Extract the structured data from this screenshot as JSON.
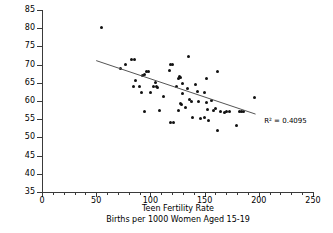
{
  "chart_data": {
    "type": "scatter",
    "title": "",
    "xlabel": "Teen Fertility Rate",
    "xlabel_line2": "Births per 1000 Women Aged 15-19",
    "ylabel": "Community Well-Being (CWB) Index Score",
    "xlim": [
      0,
      250
    ],
    "ylim": [
      35,
      85
    ],
    "x_major_ticks": [
      0,
      50,
      100,
      150,
      200,
      250
    ],
    "x_major_tick_labels": [
      "0",
      "50",
      "100",
      "150",
      "200",
      "250"
    ],
    "x_minor_tick_interval": 10,
    "y_major_ticks": [
      35,
      40,
      45,
      50,
      55,
      60,
      65,
      70,
      75,
      80,
      85
    ],
    "y_major_tick_labels": [
      "35",
      "40",
      "45",
      "50",
      "55",
      "60",
      "65",
      "70",
      "75",
      "80",
      "85"
    ],
    "grid": false,
    "legend": false,
    "marker_color": "#111111",
    "axis_color": "#3a3a3a",
    "annotations": [
      {
        "name": "r-squared",
        "text": "R² = 0.4095",
        "x": 205,
        "y": 54.5
      }
    ],
    "trendline": {
      "name": "linear-fit",
      "x_start": 50,
      "y_start": 71.1,
      "x_end": 197,
      "y_end": 56.4,
      "color": "#555555"
    },
    "points": [
      [
        55,
        80.3
      ],
      [
        72,
        68.8
      ],
      [
        77,
        70.1
      ],
      [
        83,
        71.4
      ],
      [
        85,
        71.5
      ],
      [
        84,
        63.9
      ],
      [
        86,
        65.5
      ],
      [
        90,
        64.0
      ],
      [
        92,
        62.4
      ],
      [
        93,
        67.0
      ],
      [
        95,
        67.2
      ],
      [
        96,
        68.1
      ],
      [
        98,
        68.0
      ],
      [
        95,
        57.2
      ],
      [
        100,
        62.4
      ],
      [
        103,
        63.9
      ],
      [
        105,
        65.2
      ],
      [
        106,
        64.0
      ],
      [
        107,
        63.7
      ],
      [
        108,
        57.3
      ],
      [
        112,
        61.1
      ],
      [
        118,
        68.5
      ],
      [
        119,
        70.0
      ],
      [
        120,
        70.0
      ],
      [
        119,
        54.2
      ],
      [
        121,
        54.2
      ],
      [
        124,
        64.1
      ],
      [
        126,
        66.1
      ],
      [
        127,
        66.6
      ],
      [
        128,
        66.4
      ],
      [
        128,
        59.2
      ],
      [
        129,
        59.0
      ],
      [
        130,
        64.8
      ],
      [
        130,
        62.0
      ],
      [
        126,
        57.4
      ],
      [
        132,
        58.1
      ],
      [
        135,
        72.2
      ],
      [
        134,
        63.5
      ],
      [
        136,
        60.3
      ],
      [
        138,
        59.8
      ],
      [
        139,
        55.6
      ],
      [
        142,
        64.5
      ],
      [
        143,
        62.7
      ],
      [
        144,
        60.0
      ],
      [
        146,
        55.2
      ],
      [
        150,
        55.4
      ],
      [
        152,
        66.2
      ],
      [
        150,
        62.4
      ],
      [
        152,
        59.7
      ],
      [
        153,
        57.6
      ],
      [
        154,
        54.7
      ],
      [
        156,
        60.1
      ],
      [
        158,
        57.4
      ],
      [
        160,
        58.0
      ],
      [
        162,
        68.2
      ],
      [
        162,
        51.8
      ],
      [
        165,
        57.0
      ],
      [
        168,
        56.9
      ],
      [
        170,
        57.2
      ],
      [
        173,
        57.0
      ],
      [
        179,
        53.4
      ],
      [
        182,
        57.2
      ],
      [
        184,
        57.2
      ],
      [
        186,
        57.1
      ],
      [
        196,
        61.0
      ]
    ]
  }
}
